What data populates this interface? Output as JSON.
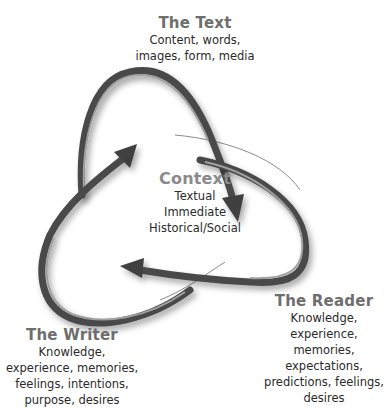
{
  "diagram": {
    "nodes": {
      "text": {
        "title": "The Text",
        "lines": [
          "Content, words,",
          "images, form, media"
        ]
      },
      "context": {
        "title": "Context",
        "lines": [
          "Textual",
          "Immediate",
          "Historical/Social"
        ]
      },
      "reader": {
        "title": "The Reader",
        "lines": [
          "Knowledge,",
          "experience, memories,",
          "expectations,",
          "predictions, feelings,",
          "desires"
        ]
      },
      "writer": {
        "title": "The Writer",
        "lines": [
          "Knowledge,",
          "experience, memories,",
          "feelings, intentions,",
          "purpose, desires"
        ]
      }
    },
    "arrows": [
      {
        "name": "text-to-context-arrow",
        "from": "The Text",
        "to": "Context"
      },
      {
        "name": "reader-to-context-arrow",
        "from": "The Reader",
        "to": "Context"
      },
      {
        "name": "writer-to-context-arrow",
        "from": "The Writer",
        "to": "Context"
      }
    ],
    "colors": {
      "arrow": "#4a4a4a",
      "arrow_highlight": "#9a9a9a",
      "title": "#6e6e6e",
      "body_text": "#2a2a2a"
    }
  }
}
